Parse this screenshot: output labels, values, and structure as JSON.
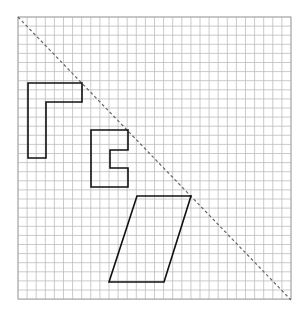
{
  "diagram": {
    "type": "reflection-grid",
    "grid": {
      "origin_px": [
        18,
        17
      ],
      "cell_px": 9.1,
      "cols": 30,
      "rows": 31,
      "line_color": "#bdbdbd",
      "border_color": "#a8a8a8"
    },
    "mirror_line": {
      "style": "dashed",
      "color": "#666666",
      "from_px": [
        18,
        17
      ],
      "to_px": [
        291,
        300
      ]
    },
    "shapes": [
      {
        "name": "l-shape",
        "color": "#111111",
        "points_px": [
          [
            28,
            83
          ],
          [
            82,
            83
          ],
          [
            82,
            102
          ],
          [
            46,
            102
          ],
          [
            46,
            158
          ],
          [
            28,
            158
          ]
        ]
      },
      {
        "name": "c-shape",
        "color": "#111111",
        "points_px": [
          [
            91,
            130
          ],
          [
            128,
            130
          ],
          [
            128,
            150
          ],
          [
            110,
            150
          ],
          [
            110,
            168
          ],
          [
            128,
            168
          ],
          [
            128,
            187
          ],
          [
            91,
            187
          ]
        ]
      },
      {
        "name": "parallelogram",
        "color": "#111111",
        "points_px": [
          [
            137,
            196
          ],
          [
            191,
            196
          ],
          [
            164,
            282
          ],
          [
            109,
            282
          ]
        ]
      }
    ]
  }
}
